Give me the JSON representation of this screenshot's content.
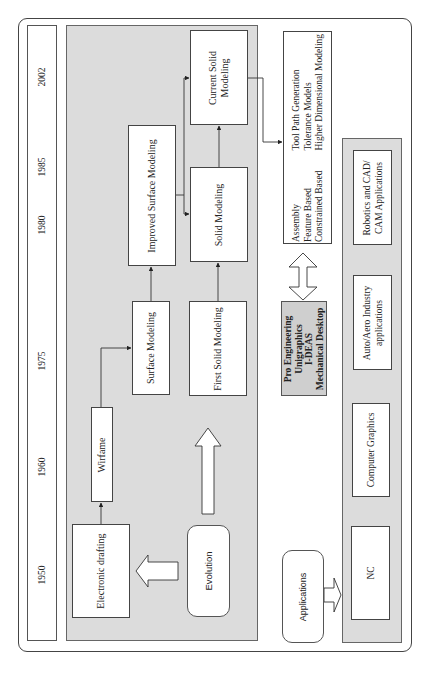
{
  "timeline": {
    "years": [
      {
        "label": "2002",
        "y": 76
      },
      {
        "label": "1985",
        "y": 166
      },
      {
        "label": "1980",
        "y": 224
      },
      {
        "label": "1975",
        "y": 360
      },
      {
        "label": "1960",
        "y": 466
      },
      {
        "label": "1950",
        "y": 574
      }
    ]
  },
  "evolution": {
    "label": "Evolution",
    "nodes": {
      "electronic_drafting": "Electronic drafting",
      "wireframe": "Wirfame",
      "surface_modeling": "Surface Modeling",
      "improved_surface_modeling": "Improved Surface Modeling",
      "first_solid_modeling": "First Solid Modeling",
      "solid_modeling": "Solid Modeling",
      "current_solid_modeling_line1": "Current Solid",
      "current_solid_modeling_line2": "Modeling"
    }
  },
  "capabilities": {
    "col1": [
      "Assembly",
      "Feature Based",
      "Constrained Based"
    ],
    "col2": [
      "Tool Path Generation",
      "Tolerance Models",
      "Higher Dimensional Modeling"
    ]
  },
  "software": {
    "items": [
      "Pro Engineering",
      "Unigraphics",
      "I-DEAS",
      "Mechanical Desktop"
    ]
  },
  "applications": {
    "label": "Applications",
    "items": [
      {
        "line1": "NC",
        "line2": ""
      },
      {
        "line1": "Computer Graphics",
        "line2": ""
      },
      {
        "line1": "Auto/Aero Industry",
        "line2": "applications"
      },
      {
        "line1": "Robotics and CAD/",
        "line2": "CAM Applications"
      }
    ]
  },
  "colors": {
    "panel": "#dcdcdc",
    "software_box": "#cfcfcf",
    "border": "#444444"
  }
}
